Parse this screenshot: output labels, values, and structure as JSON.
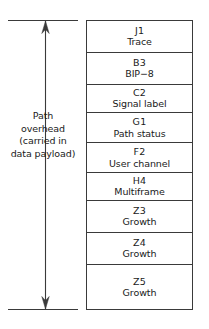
{
  "diagram": {
    "colors": {
      "stroke": "#3a3a3a",
      "text": "#1a1a1a",
      "background": "#ffffff"
    },
    "annotation": {
      "name": "path-overhead-label",
      "lines": [
        "Path",
        "overhead",
        "(carried in",
        "data payload)"
      ],
      "arrow": {
        "name": "double-headed-vertical-arrow",
        "direction": "both",
        "top_cap": true,
        "bottom_cap": true
      }
    },
    "stack": {
      "name": "path-overhead-byte-stack",
      "rows": [
        {
          "code": "J1",
          "desc": "Trace",
          "height": 32
        },
        {
          "code": "B3",
          "desc": "BIP−8",
          "height": 32
        },
        {
          "code": "C2",
          "desc": "Signal label",
          "height": 29
        },
        {
          "code": "G1",
          "desc": "Path status",
          "height": 30
        },
        {
          "code": "F2",
          "desc": "User channel",
          "height": 30
        },
        {
          "code": "H4",
          "desc": "Multiframe",
          "height": 28
        },
        {
          "code": "Z3",
          "desc": "Growth",
          "height": 32
        },
        {
          "code": "Z4",
          "desc": "Growth",
          "height": 33
        },
        {
          "code": "Z5",
          "desc": "Growth",
          "height": 44
        }
      ]
    }
  }
}
